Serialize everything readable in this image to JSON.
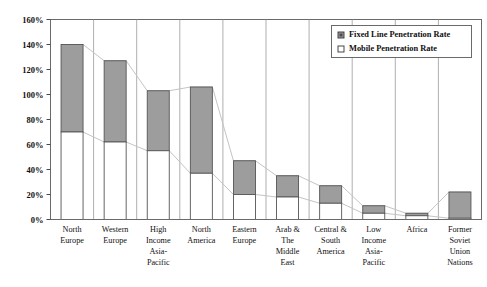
{
  "chart_data": {
    "type": "bar",
    "title": "",
    "subtitle": "",
    "xlabel": "",
    "ylabel": "",
    "stacked": true,
    "grid": false,
    "legend_position": "top-right",
    "ylim": [
      0,
      160
    ],
    "ytick_labels": [
      "0%",
      "20%",
      "40%",
      "60%",
      "80%",
      "100%",
      "120%",
      "140%",
      "160%"
    ],
    "ytick_values": [
      0,
      20,
      40,
      60,
      80,
      100,
      120,
      140,
      160
    ],
    "categories": [
      "North Europe",
      "Western Europe",
      "High Income Asia-Pacific",
      "North America",
      "Eastern Europe",
      "Arab & The Middle East",
      "Central & South America",
      "Low Income Asia-Pacific",
      "Africa",
      "Former Soviet Union Nations"
    ],
    "category_lines": [
      [
        "North",
        "Europe"
      ],
      [
        "Western",
        "Europe"
      ],
      [
        "High",
        "Income",
        "Asia-",
        "Pacific"
      ],
      [
        "North",
        "America"
      ],
      [
        "Eastern",
        "Europe"
      ],
      [
        "Arab &",
        "The",
        "Middle",
        "East"
      ],
      [
        "Central &",
        "South",
        "America"
      ],
      [
        "Low",
        "Income",
        "Asia-",
        "Pacific"
      ],
      [
        "Africa"
      ],
      [
        "Former",
        "Soviet",
        "Union",
        "Nations"
      ]
    ],
    "series": [
      {
        "name": "Mobile Penetration Rate",
        "color": "#ffffff",
        "values": [
          70,
          62,
          55,
          37,
          20,
          18,
          13,
          5,
          3,
          1
        ]
      },
      {
        "name": "Fixed Line Penetration Rate",
        "color": "#9d9d9d",
        "values": [
          70,
          65,
          48,
          69,
          27,
          17,
          14,
          6,
          2,
          21
        ]
      }
    ],
    "totals": [
      140,
      127,
      103,
      106,
      47,
      35,
      27,
      11,
      5,
      22
    ],
    "connector_lines": true
  },
  "legend": {
    "items": [
      {
        "label": "Fixed Line Penetration Rate",
        "swatch": "filled",
        "color": "#9d9d9d"
      },
      {
        "label": "Mobile Penetration Rate",
        "swatch": "empty",
        "color": "#ffffff"
      }
    ]
  },
  "colors": {
    "fixed_line": "#9d9d9d",
    "mobile": "#ffffff",
    "axis": "#4a4a4a",
    "connector": "#c4c4c4",
    "bar_outline": "#555555"
  }
}
